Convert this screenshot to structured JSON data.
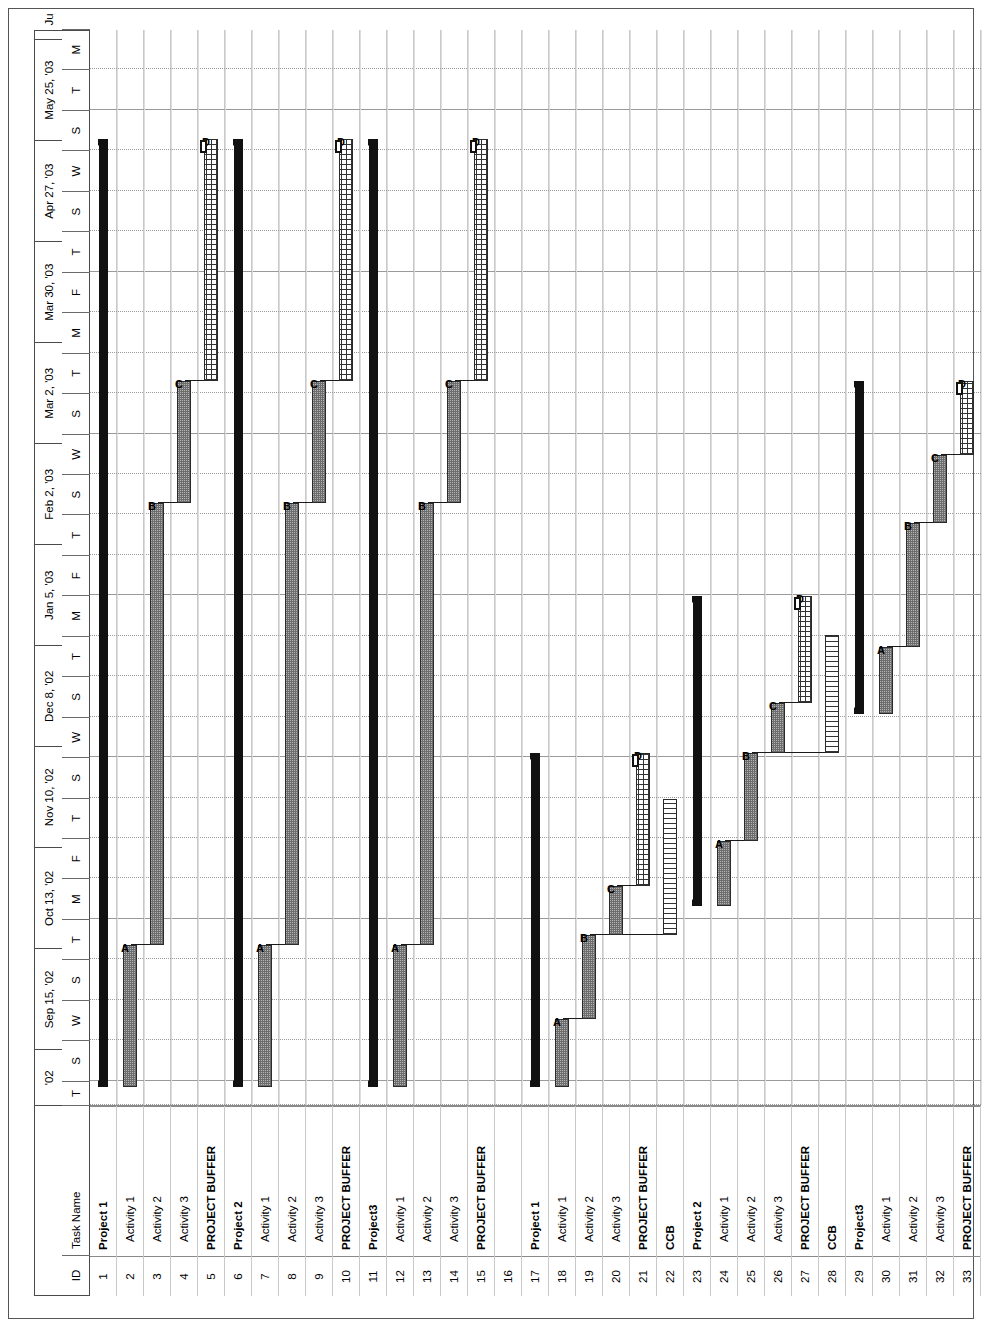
{
  "chart_data": {
    "type": "bar",
    "title": "",
    "xlabel": "",
    "ylabel": "",
    "timescale_unit": "week",
    "grid": true,
    "legend_position": "none",
    "columns": [
      "ID",
      "Task Name"
    ],
    "timeline_major": [
      "'02",
      "Sep 15, '02",
      "Oct 13, '02",
      "Nov 10, '02",
      "Dec 8, '02",
      "Jan 5, '03",
      "Feb 2, '03",
      "Mar 2, '03",
      "Mar 30, '03",
      "Apr 27, '03",
      "May 25, '03",
      "Ju"
    ],
    "timeline_minor": [
      "T",
      "S",
      "W",
      "S",
      "T",
      "M",
      "F",
      "T",
      "S",
      "W",
      "S",
      "T",
      "M",
      "F",
      "T",
      "S",
      "W",
      "S",
      "T",
      "M",
      "F",
      "T",
      "S",
      "W",
      "S",
      "T",
      "M"
    ],
    "rows": [
      {
        "id": "1",
        "name": "Project 1",
        "style": "bold"
      },
      {
        "id": "2",
        "name": "Activity 1",
        "style": "normal"
      },
      {
        "id": "3",
        "name": "Activity 2",
        "style": "normal"
      },
      {
        "id": "4",
        "name": "Activity 3",
        "style": "normal"
      },
      {
        "id": "5",
        "name": "PROJECT BUFFER",
        "style": "bold"
      },
      {
        "id": "6",
        "name": "Project 2",
        "style": "bold"
      },
      {
        "id": "7",
        "name": "Activity 1",
        "style": "normal"
      },
      {
        "id": "8",
        "name": "Activity 2",
        "style": "normal"
      },
      {
        "id": "9",
        "name": "Activity 3",
        "style": "normal"
      },
      {
        "id": "10",
        "name": "PROJECT BUFFER",
        "style": "bold"
      },
      {
        "id": "11",
        "name": "Project3",
        "style": "bold"
      },
      {
        "id": "12",
        "name": "Activity 1",
        "style": "normal"
      },
      {
        "id": "13",
        "name": "Activity 2",
        "style": "normal"
      },
      {
        "id": "14",
        "name": "Activity 3",
        "style": "normal"
      },
      {
        "id": "15",
        "name": "PROJECT BUFFER",
        "style": "bold"
      },
      {
        "id": "16",
        "name": "",
        "style": "normal"
      },
      {
        "id": "17",
        "name": "Project 1",
        "style": "bold"
      },
      {
        "id": "18",
        "name": "Activity 1",
        "style": "normal"
      },
      {
        "id": "19",
        "name": "Activity 2",
        "style": "normal"
      },
      {
        "id": "20",
        "name": "Activity 3",
        "style": "normal"
      },
      {
        "id": "21",
        "name": "PROJECT BUFFER",
        "style": "bold"
      },
      {
        "id": "22",
        "name": "CCB",
        "style": "bold"
      },
      {
        "id": "23",
        "name": "Project 2",
        "style": "bold"
      },
      {
        "id": "24",
        "name": "Activity 1",
        "style": "normal"
      },
      {
        "id": "25",
        "name": "Activity 2",
        "style": "normal"
      },
      {
        "id": "26",
        "name": "Activity 3",
        "style": "normal"
      },
      {
        "id": "27",
        "name": "PROJECT BUFFER",
        "style": "bold"
      },
      {
        "id": "28",
        "name": "CCB",
        "style": "bold"
      },
      {
        "id": "29",
        "name": "Project3",
        "style": "bold"
      },
      {
        "id": "30",
        "name": "Activity 1",
        "style": "normal"
      },
      {
        "id": "31",
        "name": "Activity 2",
        "style": "normal"
      },
      {
        "id": "32",
        "name": "Activity 3",
        "style": "normal"
      },
      {
        "id": "33",
        "name": "PROJECT BUFFER",
        "style": "bold"
      }
    ],
    "bars": [
      {
        "row": 0,
        "kind": "summary",
        "start": 0,
        "end": 840,
        "label": ""
      },
      {
        "row": 1,
        "kind": "act",
        "start": 0,
        "end": 126,
        "label": "A"
      },
      {
        "row": 2,
        "kind": "act",
        "start": 126,
        "end": 517,
        "label": "B"
      },
      {
        "row": 3,
        "kind": "act",
        "start": 517,
        "end": 625,
        "label": "C"
      },
      {
        "row": 4,
        "kind": "pbuf",
        "start": 625,
        "end": 840,
        "label": "D"
      },
      {
        "row": 5,
        "kind": "summary",
        "start": 0,
        "end": 840,
        "label": ""
      },
      {
        "row": 6,
        "kind": "act",
        "start": 0,
        "end": 126,
        "label": "A"
      },
      {
        "row": 7,
        "kind": "act",
        "start": 126,
        "end": 517,
        "label": "B"
      },
      {
        "row": 8,
        "kind": "act",
        "start": 517,
        "end": 625,
        "label": "C"
      },
      {
        "row": 9,
        "kind": "pbuf",
        "start": 625,
        "end": 840,
        "label": "D"
      },
      {
        "row": 10,
        "kind": "summary",
        "start": 0,
        "end": 840,
        "label": ""
      },
      {
        "row": 11,
        "kind": "act",
        "start": 0,
        "end": 126,
        "label": "A"
      },
      {
        "row": 12,
        "kind": "act",
        "start": 126,
        "end": 517,
        "label": "B"
      },
      {
        "row": 13,
        "kind": "act",
        "start": 517,
        "end": 625,
        "label": "C"
      },
      {
        "row": 14,
        "kind": "pbuf",
        "start": 625,
        "end": 840,
        "label": "D"
      },
      {
        "row": 16,
        "kind": "summary",
        "start": 0,
        "end": 296,
        "label": ""
      },
      {
        "row": 17,
        "kind": "act",
        "start": 0,
        "end": 60,
        "label": "A"
      },
      {
        "row": 18,
        "kind": "act",
        "start": 60,
        "end": 135,
        "label": "B"
      },
      {
        "row": 19,
        "kind": "act",
        "start": 135,
        "end": 178,
        "label": "C"
      },
      {
        "row": 20,
        "kind": "pbuf",
        "start": 178,
        "end": 296,
        "label": "D"
      },
      {
        "row": 21,
        "kind": "ccb",
        "start": 135,
        "end": 255,
        "label": ""
      },
      {
        "row": 22,
        "kind": "summary",
        "start": 160,
        "end": 435,
        "label": ""
      },
      {
        "row": 23,
        "kind": "act",
        "start": 160,
        "end": 218,
        "label": "A"
      },
      {
        "row": 24,
        "kind": "act",
        "start": 218,
        "end": 296,
        "label": "B"
      },
      {
        "row": 25,
        "kind": "act",
        "start": 296,
        "end": 340,
        "label": "C"
      },
      {
        "row": 26,
        "kind": "pbuf",
        "start": 340,
        "end": 435,
        "label": "D"
      },
      {
        "row": 27,
        "kind": "ccb",
        "start": 296,
        "end": 400,
        "label": ""
      },
      {
        "row": 28,
        "kind": "summary",
        "start": 330,
        "end": 625,
        "label": ""
      },
      {
        "row": 29,
        "kind": "act",
        "start": 330,
        "end": 390,
        "label": "A"
      },
      {
        "row": 30,
        "kind": "act",
        "start": 390,
        "end": 500,
        "label": "B"
      },
      {
        "row": 31,
        "kind": "act",
        "start": 500,
        "end": 560,
        "label": "C"
      },
      {
        "row": 32,
        "kind": "pbuf",
        "start": 560,
        "end": 625,
        "label": "D"
      }
    ],
    "links": [
      {
        "from_row": 1,
        "to_row": 2,
        "x": 126
      },
      {
        "from_row": 2,
        "to_row": 3,
        "x": 517
      },
      {
        "from_row": 3,
        "to_row": 4,
        "x": 625
      },
      {
        "from_row": 6,
        "to_row": 7,
        "x": 126
      },
      {
        "from_row": 7,
        "to_row": 8,
        "x": 517
      },
      {
        "from_row": 8,
        "to_row": 9,
        "x": 625
      },
      {
        "from_row": 11,
        "to_row": 12,
        "x": 126
      },
      {
        "from_row": 12,
        "to_row": 13,
        "x": 517
      },
      {
        "from_row": 13,
        "to_row": 14,
        "x": 625
      },
      {
        "from_row": 17,
        "to_row": 18,
        "x": 60
      },
      {
        "from_row": 18,
        "to_row": 19,
        "x": 135
      },
      {
        "from_row": 19,
        "to_row": 20,
        "x": 178
      },
      {
        "from_row": 18,
        "to_row": 21,
        "x": 135
      },
      {
        "from_row": 23,
        "to_row": 24,
        "x": 218
      },
      {
        "from_row": 24,
        "to_row": 25,
        "x": 296
      },
      {
        "from_row": 25,
        "to_row": 26,
        "x": 340
      },
      {
        "from_row": 24,
        "to_row": 27,
        "x": 296
      },
      {
        "from_row": 29,
        "to_row": 30,
        "x": 390
      },
      {
        "from_row": 30,
        "to_row": 31,
        "x": 500
      },
      {
        "from_row": 31,
        "to_row": 32,
        "x": 560
      }
    ],
    "axis_ranges": {
      "x_min_label": "'02",
      "x_max_label": "Ju"
    },
    "fills": {
      "summary": "#111111",
      "activity": "#b4b4b4",
      "project_buffer": "#ffffff",
      "feeding_buffer": "#ffffff",
      "gridline": "#9a9a9a"
    }
  }
}
